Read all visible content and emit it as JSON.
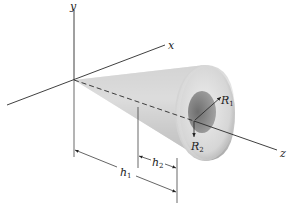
{
  "figure": {
    "axes": {
      "x_label": "x",
      "y_label": "y",
      "z_label": "z"
    },
    "labels": {
      "R1": {
        "main": "R",
        "sub": "1"
      },
      "R2": {
        "main": "R",
        "sub": "2"
      },
      "h1": {
        "main": "h",
        "sub": "1"
      },
      "h2": {
        "main": "h",
        "sub": "2"
      }
    },
    "colors": {
      "line": "#2a2a2a",
      "cone_light": "#e6e6e6",
      "cone_mid": "#c4c4c4",
      "cone_dark": "#9a9a9a",
      "hole": "#8c8c8c"
    }
  }
}
